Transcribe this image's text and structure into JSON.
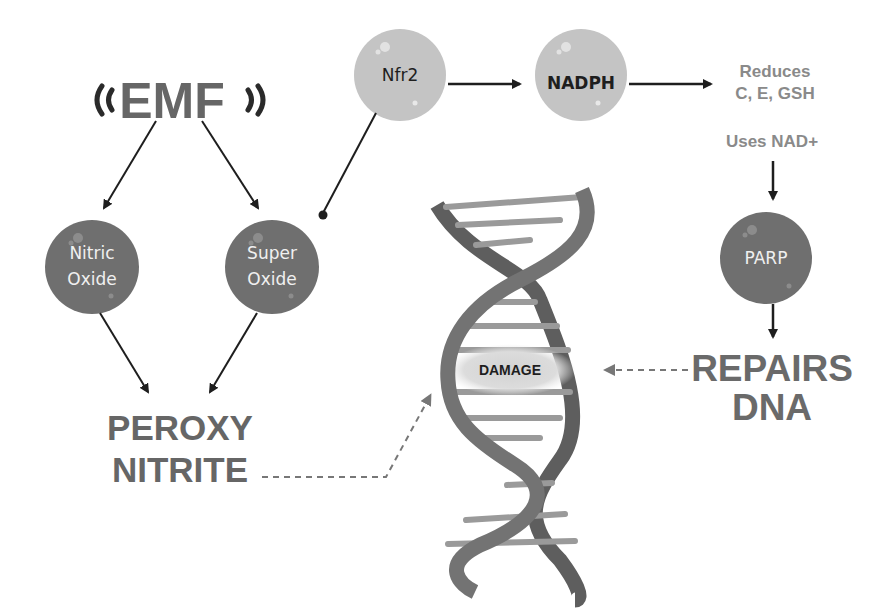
{
  "colors": {
    "background": "#ffffff",
    "dark_node": "#6f6f6f",
    "light_node": "#c4c4c4",
    "heading_text": "#666666",
    "soft_text": "#8a8a8a",
    "arrow": "#1e1e1e",
    "dna_strand_dark": "#5f5f5f",
    "dna_strand_mid": "#757575",
    "dna_rung": "#9a9a9a",
    "damage_glow": "#d9d9d9"
  },
  "emf": {
    "label": "EMF",
    "icon_left": "signal-waves-left-icon",
    "icon_right": "signal-waves-right-icon"
  },
  "nodes": {
    "nitric_oxide": {
      "line1": "Nitric",
      "line2": "Oxide",
      "style": "dark"
    },
    "super_oxide": {
      "line1": "Super",
      "line2": "Oxide",
      "style": "dark"
    },
    "nfr2": {
      "label": "Nfr2",
      "style": "light"
    },
    "nadph": {
      "label": "NADPH",
      "style": "light"
    },
    "parp": {
      "label": "PARP",
      "style": "dark"
    }
  },
  "texts": {
    "reduces_line1": "Reduces",
    "reduces_line2": "C, E, GSH",
    "uses_nad": "Uses NAD+",
    "peroxy_line1": "PEROXY",
    "peroxy_line2": "NITRITE",
    "repairs_line1": "REPAIRS",
    "repairs_line2": "DNA",
    "damage": "DAMAGE"
  },
  "edges": [
    {
      "from": "EMF",
      "to": "Nitric Oxide",
      "type": "arrow"
    },
    {
      "from": "EMF",
      "to": "Super Oxide",
      "type": "arrow"
    },
    {
      "from": "Nfr2",
      "to": "Super Oxide",
      "type": "inhibit-dot"
    },
    {
      "from": "Nfr2",
      "to": "NADPH",
      "type": "arrow"
    },
    {
      "from": "NADPH",
      "to": "Reduces C, E, GSH",
      "type": "arrow"
    },
    {
      "from": "Uses NAD+",
      "to": "PARP",
      "type": "arrow"
    },
    {
      "from": "PARP",
      "to": "REPAIRS DNA",
      "type": "arrow"
    },
    {
      "from": "Nitric Oxide",
      "to": "PEROXY NITRITE",
      "type": "arrow"
    },
    {
      "from": "Super Oxide",
      "to": "PEROXY NITRITE",
      "type": "arrow"
    },
    {
      "from": "PEROXY NITRITE",
      "to": "DNA",
      "type": "dashed-arrow"
    },
    {
      "from": "REPAIRS DNA",
      "to": "DAMAGE",
      "type": "dashed-arrow"
    }
  ]
}
